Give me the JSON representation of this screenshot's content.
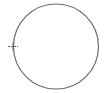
{
  "diagram": {
    "shape": "circle",
    "center": [
      56,
      46.5
    ],
    "radius": 42.5,
    "stroke_color": "#6b6b6b",
    "background": "#ffffff",
    "marker": {
      "type": "cross-tick",
      "position": [
        13,
        46.5
      ],
      "color": "#6b6b6b"
    }
  }
}
